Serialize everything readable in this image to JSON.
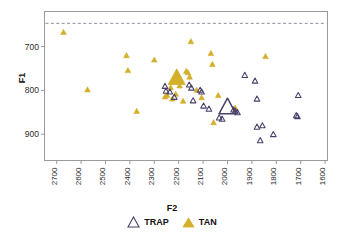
{
  "chart_data": {
    "type": "scatter",
    "title": "",
    "xlabel": "F2",
    "ylabel": "F1",
    "xlim": [
      2750,
      1590
    ],
    "ylim": [
      620,
      960
    ],
    "x_reversed": true,
    "y_reversed": true,
    "grid": false,
    "legend_position": "bottom-center",
    "xticks": [
      2700,
      2600,
      2500,
      2400,
      2300,
      2200,
      2100,
      2000,
      1900,
      1800,
      1700,
      1600
    ],
    "yticks": [
      700,
      800,
      900
    ],
    "xticklabels": [
      "2700",
      "2600",
      "2500",
      "2400",
      "2300",
      "2200",
      "2100",
      "2000",
      "1900",
      "1800",
      "1700",
      "1600"
    ],
    "yticklabels": [
      "700",
      "800",
      "900"
    ],
    "annotations": [
      {
        "name": "reference-line",
        "type": "hline",
        "y": 647,
        "style": "dashed",
        "color": "#8f8f9e"
      }
    ],
    "series": [
      {
        "name": "TRAP",
        "marker": "triangle-open",
        "color": "#4a3f6b",
        "fill": "none",
        "points": [
          {
            "x": 2256,
            "y": 791
          },
          {
            "x": 2252,
            "y": 802
          },
          {
            "x": 2236,
            "y": 804
          },
          {
            "x": 2218,
            "y": 816
          },
          {
            "x": 2157,
            "y": 788
          },
          {
            "x": 2148,
            "y": 795
          },
          {
            "x": 2141,
            "y": 824
          },
          {
            "x": 2112,
            "y": 800
          },
          {
            "x": 2106,
            "y": 804
          },
          {
            "x": 2098,
            "y": 836
          },
          {
            "x": 2076,
            "y": 843
          },
          {
            "x": 2034,
            "y": 863
          },
          {
            "x": 2022,
            "y": 866
          },
          {
            "x": 1975,
            "y": 845
          },
          {
            "x": 1968,
            "y": 848
          },
          {
            "x": 1959,
            "y": 851
          },
          {
            "x": 1929,
            "y": 766
          },
          {
            "x": 1887,
            "y": 779
          },
          {
            "x": 1879,
            "y": 820
          },
          {
            "x": 1879,
            "y": 884
          },
          {
            "x": 1857,
            "y": 881
          },
          {
            "x": 1866,
            "y": 915
          },
          {
            "x": 1812,
            "y": 901
          },
          {
            "x": 1710,
            "y": 812
          },
          {
            "x": 1718,
            "y": 858
          },
          {
            "x": 1713,
            "y": 860
          }
        ],
        "mean": {
          "x": 2000,
          "y": 840
        }
      },
      {
        "name": "TAN",
        "marker": "triangle-filled",
        "color": "#d4af2a",
        "points": [
          {
            "x": 2672,
            "y": 668
          },
          {
            "x": 2574,
            "y": 799
          },
          {
            "x": 2414,
            "y": 721
          },
          {
            "x": 2408,
            "y": 755
          },
          {
            "x": 2372,
            "y": 848
          },
          {
            "x": 2300,
            "y": 731
          },
          {
            "x": 2256,
            "y": 815
          },
          {
            "x": 2248,
            "y": 812
          },
          {
            "x": 2233,
            "y": 794
          },
          {
            "x": 2226,
            "y": 820
          },
          {
            "x": 2212,
            "y": 809
          },
          {
            "x": 2196,
            "y": 790
          },
          {
            "x": 2182,
            "y": 825
          },
          {
            "x": 2169,
            "y": 757
          },
          {
            "x": 2162,
            "y": 760
          },
          {
            "x": 2155,
            "y": 770
          },
          {
            "x": 2150,
            "y": 689
          },
          {
            "x": 2126,
            "y": 800
          },
          {
            "x": 2106,
            "y": 817
          },
          {
            "x": 2068,
            "y": 716
          },
          {
            "x": 2062,
            "y": 741
          },
          {
            "x": 2057,
            "y": 874
          },
          {
            "x": 2038,
            "y": 812
          },
          {
            "x": 1968,
            "y": 841
          },
          {
            "x": 1844,
            "y": 723
          }
        ],
        "mean": {
          "x": 2208,
          "y": 773
        }
      }
    ]
  },
  "legend": {
    "entries": [
      {
        "label": "TRAP",
        "marker": "triangle-open",
        "color": "#4a3f6b"
      },
      {
        "label": "TAN",
        "marker": "triangle-filled",
        "color": "#d4af2a"
      }
    ]
  },
  "axes": {
    "x_title": "F2",
    "y_title": "F1"
  },
  "style": {
    "frame_color": "#9a9a9a",
    "trap_color": "#4a3f6b",
    "tan_color": "#d4af2a",
    "dash_color": "#8f8f9e",
    "tick_label_color": "#2b2b2b"
  }
}
